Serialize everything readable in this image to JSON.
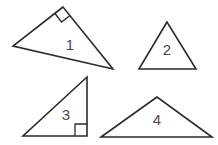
{
  "figure": {
    "shapes": [
      {
        "label": "1",
        "type": "right triangle",
        "right_angle_marker": true
      },
      {
        "label": "2",
        "type": "triangle",
        "right_angle_marker": false
      },
      {
        "label": "3",
        "type": "right triangle",
        "right_angle_marker": true
      },
      {
        "label": "4",
        "type": "obtuse triangle",
        "right_angle_marker": false
      }
    ],
    "stroke_color": "#2b2b2b",
    "label_color": "#4a4a4a"
  }
}
